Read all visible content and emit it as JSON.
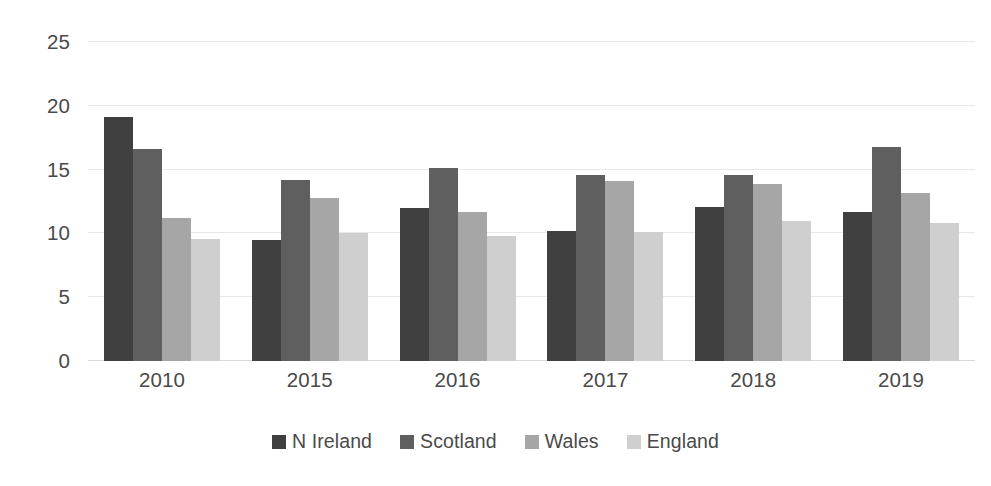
{
  "chart_data": {
    "type": "bar",
    "title": "",
    "subtitle": "",
    "xlabel": "",
    "ylabel": "",
    "categories": [
      "2010",
      "2015",
      "2016",
      "2017",
      "2018",
      "2019"
    ],
    "series": [
      {
        "name": "N Ireland",
        "color": "#404040",
        "values": [
          19.1,
          9.5,
          12.0,
          10.2,
          12.1,
          11.7
        ]
      },
      {
        "name": "Scotland",
        "color": "#5f5f5f",
        "values": [
          16.6,
          14.2,
          15.1,
          14.6,
          14.6,
          16.8
        ]
      },
      {
        "name": "Wales",
        "color": "#a6a6a6",
        "values": [
          11.2,
          12.8,
          11.7,
          14.1,
          13.9,
          13.2
        ]
      },
      {
        "name": "England",
        "color": "#cfcfcf",
        "values": [
          9.6,
          10.0,
          9.8,
          10.1,
          11.0,
          10.8
        ]
      }
    ],
    "ylim": [
      0,
      25
    ],
    "yticks": [
      0,
      5,
      10,
      15,
      20,
      25
    ],
    "ytick_labels": [
      "0",
      "5",
      "10",
      "15",
      "20",
      "25"
    ],
    "grid": true,
    "grid_axis": "y",
    "legend_position": "bottom",
    "bar_gap": 0,
    "group_gap": true
  },
  "axis": {
    "y_label_color": "#4a4a4a",
    "x_label_color": "#4a4a4a",
    "gridline_color": "#e8e8e8",
    "baseline_color": "#d9d9d9"
  },
  "background": "#ffffff"
}
